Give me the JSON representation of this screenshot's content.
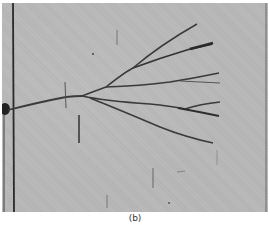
{
  "figure": {
    "caption": "(b)",
    "colors": {
      "background": "#b9b9b9",
      "crack": "#3a3a3a",
      "border_line": "#2a2a2a"
    }
  }
}
